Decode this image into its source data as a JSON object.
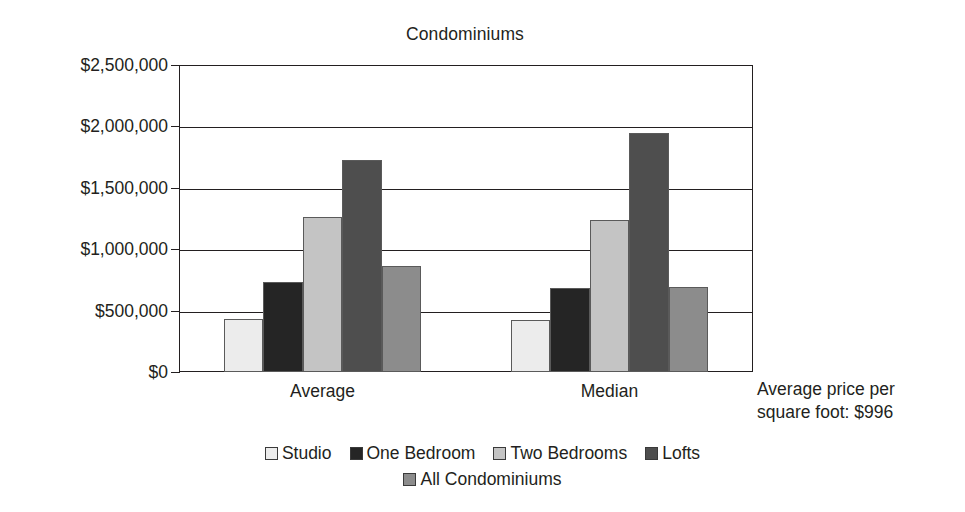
{
  "chart_data": {
    "type": "bar",
    "title": "Condominiums",
    "xlabel": "",
    "ylabel": "",
    "categories": [
      "Average",
      "Median"
    ],
    "series": [
      {
        "name": "Studio",
        "color": "#ececec",
        "values": [
          430000,
          425000
        ]
      },
      {
        "name": "One Bedroom",
        "color": "#252525",
        "values": [
          733000,
          684000
        ]
      },
      {
        "name": "Two Bedrooms",
        "color": "#c4c4c4",
        "values": [
          1262000,
          1238000
        ]
      },
      {
        "name": "Lofts",
        "color": "#4e4e4e",
        "values": [
          1725000,
          1950000
        ]
      },
      {
        "name": "All Condominiums",
        "color": "#8c8c8c",
        "values": [
          865000,
          695000
        ]
      }
    ],
    "ylim": [
      0,
      2500000
    ],
    "ytick_values": [
      0,
      500000,
      1000000,
      1500000,
      2000000,
      2500000
    ],
    "ytick_labels": [
      "$0",
      "$500,000",
      "$1,000,000",
      "$1,500,000",
      "$2,000,000",
      "$2,500,000"
    ],
    "grid": true,
    "legend_position": "bottom",
    "annotation": {
      "line1": "Average price per",
      "line2": "square foot: $996"
    }
  }
}
